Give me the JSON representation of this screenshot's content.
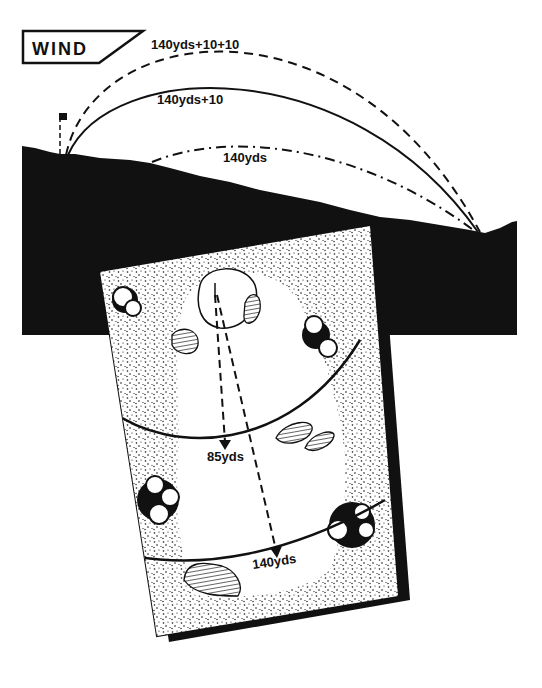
{
  "wind_sign": {
    "label": "WIND"
  },
  "trajectories": [
    {
      "id": "wind-plus-20",
      "label": "140yds+10+10",
      "style": "dashed"
    },
    {
      "id": "wind-plus-10",
      "label": "140yds+10",
      "style": "solid"
    },
    {
      "id": "no-wind",
      "label": "140yds",
      "style": "dash-dot"
    }
  ],
  "hole_map": {
    "distance_markers": [
      {
        "id": "arc-85",
        "label": "85yds"
      },
      {
        "id": "arc-140",
        "label": "140yds"
      }
    ]
  },
  "colors": {
    "ink": "#111111",
    "paper": "#ffffff"
  }
}
